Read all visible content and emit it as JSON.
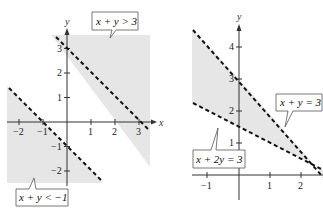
{
  "figures": [
    {
      "id": "left",
      "description": "Two disjoint half-planes: x + y > 3 and x + y < -1",
      "x_axis": {
        "label": "x",
        "ticks": [
          -2,
          -1,
          1,
          2,
          3
        ],
        "tick_labels": [
          "−2",
          "−1",
          "1",
          "2",
          "3"
        ]
      },
      "y_axis": {
        "label": "y",
        "ticks": [
          3,
          2,
          1,
          -1,
          -2
        ],
        "tick_labels": [
          "3",
          "2",
          "1",
          "−1",
          "−2"
        ]
      },
      "lines": [
        {
          "equation": "x + y = 3",
          "style": "dashed"
        },
        {
          "equation": "x + y = -1",
          "style": "dashed"
        }
      ],
      "labels": {
        "upper": "x + y > 3",
        "lower": "x + y < −1"
      },
      "shading_color": "#e4e4e4"
    },
    {
      "id": "right",
      "description": "Strip between x + 2y = 3 and x + y = 3",
      "x_axis": {
        "label": "",
        "ticks": [
          -1,
          1,
          2
        ],
        "tick_labels": [
          "−1",
          "1",
          "2"
        ]
      },
      "y_axis": {
        "label": "y",
        "ticks": [
          4,
          3,
          2,
          1
        ],
        "tick_labels": [
          "4",
          "3",
          "2",
          "1"
        ]
      },
      "lines": [
        {
          "equation": "x + y = 3",
          "style": "dashed"
        },
        {
          "equation": "x + 2y = 3",
          "style": "dashed"
        }
      ],
      "labels": {
        "line1": "x + y = 3",
        "line2": "x + 2y = 3"
      },
      "shading_color": "#e4e4e4"
    }
  ],
  "colors": {
    "shade": "#e6e6e6",
    "axis": "#333333",
    "dash": "#111111",
    "box_border": "#555555"
  }
}
